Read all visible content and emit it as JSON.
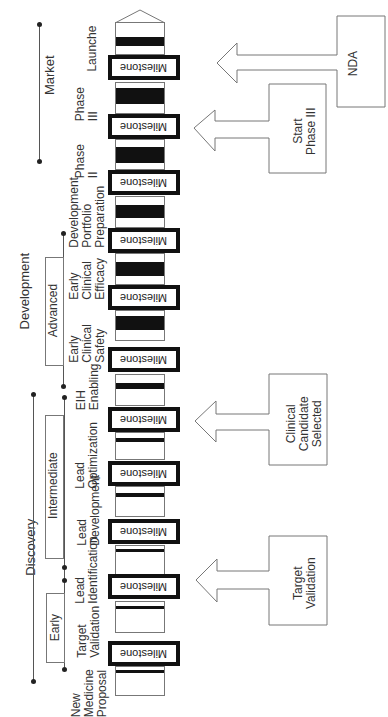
{
  "diagram": {
    "orientation": "rotated -90deg (reads bottom to top)",
    "phases": [
      {
        "id": "market",
        "label": "Market"
      },
      {
        "id": "development",
        "label": "Development"
      },
      {
        "id": "discovery",
        "label": "Discovery"
      }
    ],
    "subphases": [
      {
        "id": "advanced",
        "label": "Advanced"
      },
      {
        "id": "intermediate",
        "label": "Intermediate"
      },
      {
        "id": "early",
        "label": "Early"
      }
    ],
    "stages": [
      {
        "label": "Launche"
      },
      {
        "label": "Phase\nIII"
      },
      {
        "label": "Phase\nII"
      },
      {
        "label": "Development\nPortfolio\nPreparation"
      },
      {
        "label": "Early\nClinical\nEfficacy"
      },
      {
        "label": "Early\nClinical\nSafety"
      },
      {
        "label": "EIH\nEnabling"
      },
      {
        "label": "Lead\nOptimization"
      },
      {
        "label": "Lead\nDevelopment"
      },
      {
        "label": "Lead\nIdentification"
      },
      {
        "label": "Target\nValidation"
      },
      {
        "label": "New\nMedicine\nProposal"
      }
    ],
    "milestone_label": "Milestone",
    "callouts": [
      {
        "label": "NDA"
      },
      {
        "label": "Start\nPhase III"
      },
      {
        "label": "Clinical\nCandidate\nSelected"
      },
      {
        "label": "Target\nValidation"
      }
    ]
  }
}
